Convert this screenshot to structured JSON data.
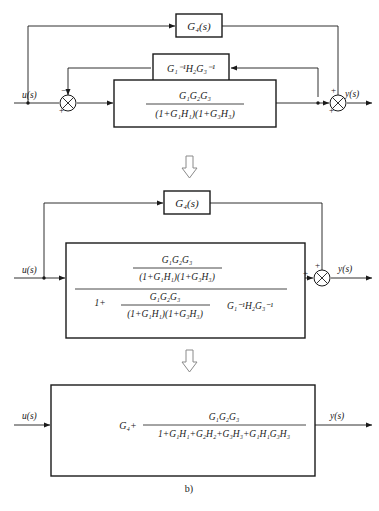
{
  "figure": {
    "caption": "b)",
    "signals": {
      "input": "u(s)",
      "output": "y(s)"
    },
    "signs": {
      "plus": "+",
      "minus": "−"
    }
  },
  "diagram_top": {
    "feedforward_block": "G₄(s)",
    "feedback_block": {
      "g1_inv": "G",
      "g1_sub": "1",
      "g1_sup": "−1",
      "h2": "H",
      "h2_sub": "2",
      "g3_inv": "G",
      "g3_sub": "3",
      "g3_sup": "−1",
      "text": "G₁⁻¹H₂G₃⁻¹"
    },
    "plant_block": {
      "numerator": "G₁G₂G₃",
      "denominator": "(1+G₁H₁)(1+G₃H₃)"
    },
    "sum_left": {
      "left_sign": "+",
      "top_sign": "−"
    },
    "sum_right": {
      "left_sign": "+",
      "top_sign": "+"
    }
  },
  "diagram_middle": {
    "feedforward_block": "G₄(s)",
    "main_block": {
      "upper_numerator": "G₁G₂G₃",
      "upper_denominator": "(1+G₁H₁)(1+G₃H₃)",
      "lower_one_plus": "1+",
      "lower_numerator": "G₁G₂G₃",
      "lower_denominator": "(1+G₁H₁)(1+G₃H₃)",
      "lower_tail": "G₁⁻¹H₂G₃⁻¹"
    },
    "sum_right": {
      "left_sign": "+",
      "top_sign": "+"
    }
  },
  "diagram_bottom": {
    "block": {
      "prefix": "G₄+",
      "numerator": "G₁G₂G₃",
      "denominator": "1+G₁H₁+G₂H₂+G₃H₃+G₁H₁G₃H₃"
    }
  },
  "connectors": {
    "arrow_1": "down-arrow",
    "arrow_2": "down-arrow"
  }
}
